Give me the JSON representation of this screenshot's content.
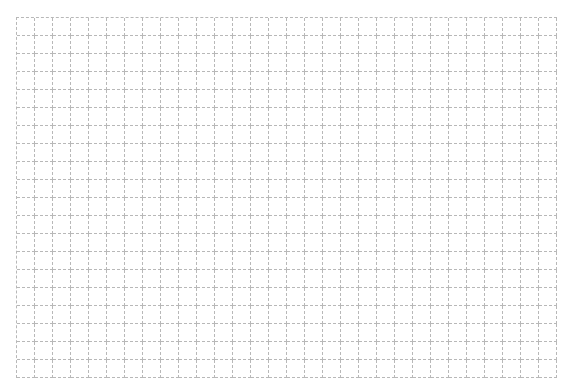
{
  "grid": {
    "columns": 30,
    "rows": 20,
    "cell_size": 18,
    "line_color": "#b8b8b8",
    "line_style": "dashed",
    "background": "#ffffff"
  }
}
